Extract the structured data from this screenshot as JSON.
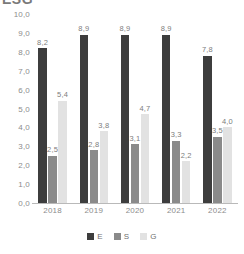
{
  "chart": {
    "title_partial": "ESG",
    "x_axis_label": "",
    "y_axis_label": ""
  },
  "legend": {
    "position": "bottom-center",
    "items": [
      {
        "label": "E",
        "color": "#3d3d3d",
        "swatch_name": "legend-swatch-e"
      },
      {
        "label": "S",
        "color": "#8a8a8a",
        "swatch_name": "legend-swatch-s"
      },
      {
        "label": "G",
        "color": "#e2e2e2",
        "swatch_name": "legend-swatch-g"
      }
    ]
  },
  "y_ticks": [
    "10,0",
    "9,0",
    "8,0",
    "7,0",
    "6,0",
    "5,0",
    "4,0",
    "3,0",
    "2,0",
    "1,0",
    "0,0"
  ],
  "x_ticks": [
    "2018",
    "2019",
    "2020",
    "2021",
    "2022"
  ],
  "bar_labels": {
    "y2018": {
      "E": "8,2",
      "S": "2,5",
      "G": "5,4"
    },
    "y2019": {
      "E": "8,9",
      "S": "2,8",
      "G": "3,8"
    },
    "y2020": {
      "E": "8,9",
      "S": "3,1",
      "G": "4,7"
    },
    "y2021": {
      "E": "8,9",
      "S": "3,3",
      "G": "2,2"
    },
    "y2022": {
      "E": "7,8",
      "S": "3,5",
      "G": "4,0"
    }
  },
  "chart_data": {
    "type": "bar",
    "title": "ESG",
    "xlabel": "",
    "ylabel": "",
    "ylim": [
      0,
      10
    ],
    "ytick_step": 1,
    "grid": false,
    "legend_position": "bottom",
    "decimal_separator": ",",
    "categories": [
      "2018",
      "2019",
      "2020",
      "2021",
      "2022"
    ],
    "series": [
      {
        "name": "E",
        "color": "#3d3d3d",
        "values": [
          8.2,
          8.9,
          8.9,
          8.9,
          7.8
        ]
      },
      {
        "name": "S",
        "color": "#8a8a8a",
        "values": [
          2.5,
          2.8,
          3.1,
          3.3,
          3.5
        ]
      },
      {
        "name": "G",
        "color": "#e2e2e2",
        "values": [
          5.4,
          3.8,
          4.7,
          2.2,
          4.0
        ]
      }
    ]
  }
}
